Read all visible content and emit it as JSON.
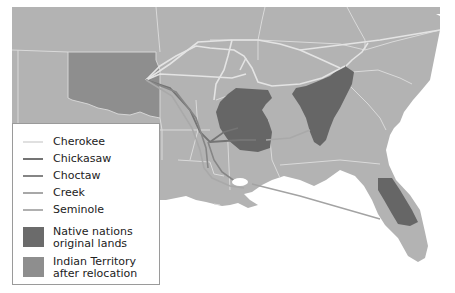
{
  "map": {
    "description": "Southeastern United States map showing Trail of Tears relocation routes",
    "colors": {
      "land": "#b3b3b3",
      "indian_territory": "#8f8f8f",
      "original_lands": "#666666",
      "state_border": "#dcdcdc",
      "cherokee_route": "#e6e6e6",
      "chickasaw_route": "#787878",
      "choctaw_route": "#8a8a8a",
      "creek_route": "#a6a6a6",
      "seminole_route": "#a3a3a3",
      "water": "#ffffff"
    }
  },
  "legend": {
    "routes": [
      {
        "label": "Cherokee",
        "color": "#e0e0e0"
      },
      {
        "label": "Chickasaw",
        "color": "#747474"
      },
      {
        "label": "Choctaw",
        "color": "#858585"
      },
      {
        "label": "Creek",
        "color": "#a8a8a8"
      },
      {
        "label": "Seminole",
        "color": "#b0b0b0"
      }
    ],
    "areas": [
      {
        "line1": "Native nations",
        "line2": "original lands",
        "color": "#6b6b6b"
      },
      {
        "line1": "Indian Territory",
        "line2": "after relocation",
        "color": "#8e8e8e"
      }
    ]
  }
}
